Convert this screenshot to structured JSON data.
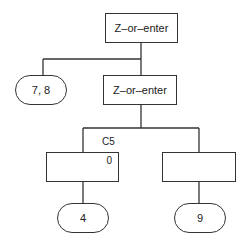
{
  "diagram": {
    "nodes": [
      {
        "id": "root",
        "label": "Z–or–enter",
        "shape": "rect"
      },
      {
        "id": "leaf-7-8",
        "label": "7, 8",
        "shape": "terminal"
      },
      {
        "id": "inner",
        "label": "Z–or–enter",
        "shape": "rect"
      },
      {
        "id": "left-child",
        "label": "",
        "shape": "rect",
        "corner_value": "0",
        "edge_label": "C5"
      },
      {
        "id": "right-child",
        "label": "",
        "shape": "rect"
      },
      {
        "id": "leaf-4",
        "label": "4",
        "shape": "terminal"
      },
      {
        "id": "leaf-9",
        "label": "9",
        "shape": "terminal"
      }
    ],
    "edges": [
      [
        "root",
        "leaf-7-8"
      ],
      [
        "root",
        "inner"
      ],
      [
        "inner",
        "left-child"
      ],
      [
        "inner",
        "right-child"
      ],
      [
        "left-child",
        "leaf-4"
      ],
      [
        "right-child",
        "leaf-9"
      ]
    ]
  }
}
